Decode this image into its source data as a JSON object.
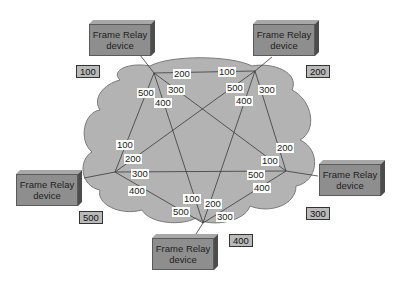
{
  "diagram": {
    "cloud_color": "#b3b3b3",
    "device_color": "#8e8e8e",
    "line_color": "#3a3a3a"
  },
  "devices": [
    {
      "id": "A",
      "line1": "Frame Relay",
      "line2": "device",
      "dlci_tag": "100"
    },
    {
      "id": "B",
      "line1": "Frame Relay",
      "line2": "device",
      "dlci_tag": "200"
    },
    {
      "id": "C",
      "line1": "Frame Relay",
      "line2": "device",
      "dlci_tag": "300"
    },
    {
      "id": "D",
      "line1": "Frame Relay",
      "line2": "device",
      "dlci_tag": "400"
    },
    {
      "id": "E",
      "line1": "Frame Relay",
      "line2": "device",
      "dlci_tag": "500"
    }
  ],
  "links": [
    {
      "from": "A",
      "to": "B",
      "label_at_A": "200",
      "label_at_B": "100"
    },
    {
      "from": "A",
      "to": "C",
      "label_at_A": "300",
      "label_at_C": "100"
    },
    {
      "from": "A",
      "to": "D",
      "label_at_A": "400",
      "label_at_D": "100"
    },
    {
      "from": "A",
      "to": "E",
      "label_at_A": "500",
      "label_at_E": "100"
    },
    {
      "from": "B",
      "to": "C",
      "label_at_B": "300",
      "label_at_C": "200"
    },
    {
      "from": "B",
      "to": "D",
      "label_at_B": "400",
      "label_at_D": "200"
    },
    {
      "from": "B",
      "to": "E",
      "label_at_B": "500",
      "label_at_E": "200"
    },
    {
      "from": "C",
      "to": "D",
      "label_at_C": "400",
      "label_at_D": "300"
    },
    {
      "from": "C",
      "to": "E",
      "label_at_C": "500",
      "label_at_E": "300"
    },
    {
      "from": "D",
      "to": "E",
      "label_at_D": "500",
      "label_at_E": "400"
    }
  ],
  "labels": {
    "a_200": "200",
    "a_300": "300",
    "a_400": "400",
    "a_500": "500",
    "b_100": "100",
    "b_300": "300",
    "b_400": "400",
    "b_500": "500",
    "c_100": "100",
    "c_200": "200",
    "c_400": "400",
    "c_500": "500",
    "d_100": "100",
    "d_200": "200",
    "d_300": "300",
    "d_500": "500",
    "e_100": "100",
    "e_200": "200",
    "e_300": "300",
    "e_400": "400"
  }
}
